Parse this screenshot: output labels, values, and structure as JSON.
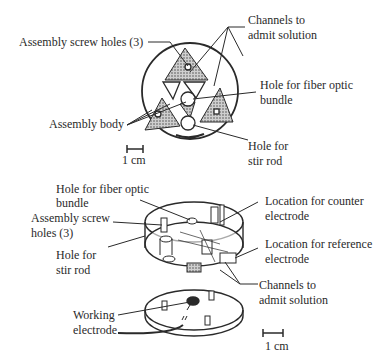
{
  "top_view": {
    "labels": {
      "channels": [
        "Channels to",
        "admit solution"
      ],
      "screw_holes": "Assembly screw holes (3)",
      "fiber_hole": [
        "Hole for fiber optic",
        "bundle"
      ],
      "assembly_body": "Assembly body",
      "stir_hole": [
        "Hole for",
        "stir rod"
      ],
      "scale": "1 cm"
    }
  },
  "exploded_view": {
    "labels": {
      "fiber_hole": [
        "Hole for fiber optic",
        "bundle"
      ],
      "screw_holes": [
        "Assembly screw",
        "holes (3)"
      ],
      "stir_hole": [
        "Hole for",
        "stir rod"
      ],
      "counter_electrode": [
        "Location for counter",
        "electrode"
      ],
      "reference_electrode": [
        "Location for reference",
        "electrode"
      ],
      "channels": [
        "Channels to",
        "admit solution"
      ],
      "working_electrode": [
        "Working",
        "electrode"
      ],
      "scale": "1 cm"
    }
  },
  "colors": {
    "ink": "#2a2a2a",
    "shade": "#8a8a8a",
    "background": "#ffffff"
  }
}
